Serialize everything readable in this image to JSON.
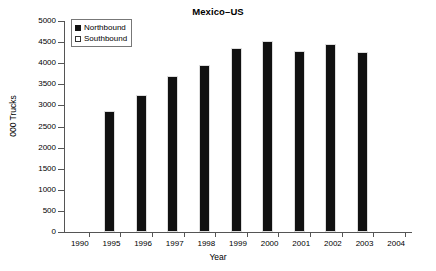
{
  "chart_data": {
    "type": "bar",
    "title": "Mexico–US",
    "xlabel": "Year",
    "ylabel": "000 Trucks",
    "categories": [
      "1990",
      "1995",
      "1996",
      "1997",
      "1998",
      "1999",
      "2000",
      "2001",
      "2002",
      "2003",
      "2004"
    ],
    "series": [
      {
        "name": "Northbound",
        "values": [
          null,
          2870,
          3250,
          3690,
          3960,
          4350,
          4530,
          4300,
          4450,
          4260,
          null
        ]
      },
      {
        "name": "Southbound",
        "values": [
          null,
          null,
          null,
          null,
          null,
          null,
          null,
          null,
          null,
          null,
          null
        ]
      }
    ],
    "ylim": [
      0,
      5000
    ],
    "yticks": [
      0,
      500,
      1000,
      1500,
      2000,
      2500,
      3000,
      3500,
      4000,
      4500,
      5000
    ],
    "ytick_labels": [
      "0",
      "500",
      "1000",
      "1500",
      "2000",
      "2500",
      "3000",
      "3500",
      "4000",
      "4500",
      "5000"
    ],
    "grid": false,
    "legend_position": "upper-left",
    "bar_color": "#111111",
    "axis_color": "#555555",
    "background": "#ffffff"
  },
  "legend": {
    "entries": [
      {
        "label": "Northbound",
        "swatch": "filled"
      },
      {
        "label": "Southbound",
        "swatch": "open"
      }
    ]
  }
}
